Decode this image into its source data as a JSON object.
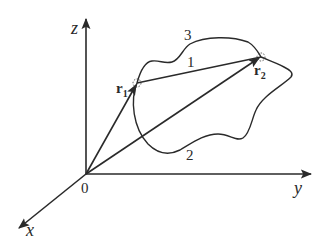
{
  "figure": {
    "axes": {
      "z_label": "z",
      "y_label": "y",
      "x_label": "x",
      "origin_label": "0"
    },
    "points": {
      "r1": {
        "symbol": "r",
        "subscript": "1"
      },
      "r2": {
        "symbol": "r",
        "subscript": "2"
      }
    },
    "paths": [
      {
        "id": "1",
        "label": "1",
        "shape": "straight segment from r1 to r2"
      },
      {
        "id": "2",
        "label": "2",
        "shape": "lower wavy curve from r1 to r2"
      },
      {
        "id": "3",
        "label": "3",
        "shape": "upper wavy curve from r1 to r2"
      }
    ],
    "colors": {
      "ink": "#2a2a2a",
      "background": "#ffffff"
    }
  }
}
